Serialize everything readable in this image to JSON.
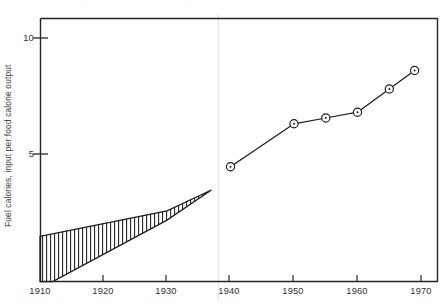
{
  "figure": {
    "title": "",
    "y_axis_label": "Fuel calories, input per food calorie output",
    "ghost_marks": [
      "..",
      "."
    ]
  },
  "axes": {
    "x_ticks": [
      "1910",
      "1920",
      "1930",
      "1940",
      "1950",
      "1960",
      "1970"
    ],
    "y_ticks": [
      "5",
      "10"
    ]
  },
  "chart_data": {
    "type": "line",
    "title": "",
    "xlabel": "",
    "ylabel": "Fuel calories, input per food calorie output",
    "xlim": [
      1910,
      1970
    ],
    "ylim": [
      0,
      10.9
    ],
    "x_ticks": [
      1910,
      1920,
      1930,
      1940,
      1950,
      1960,
      1970
    ],
    "y_ticks": [
      5,
      10
    ],
    "grid": false,
    "legend": null,
    "series": [
      {
        "name": "Fuel calories per food calorie",
        "marker": "circle-with-dot",
        "x": [
          1940,
          1950,
          1955,
          1960,
          1965,
          1969
        ],
        "values": [
          4.45,
          6.3,
          6.55,
          6.8,
          7.8,
          8.6
        ]
      },
      {
        "name": "Estimated range (upper bound)",
        "marker": "none",
        "x": [
          1910,
          1930,
          1937
        ],
        "values": [
          1.45,
          2.55,
          3.45
        ]
      },
      {
        "name": "Estimated range (lower bound)",
        "marker": "none",
        "x": [
          1912,
          1930,
          1937
        ],
        "values": [
          0.0,
          2.15,
          3.45
        ]
      }
    ],
    "annotations": [
      {
        "type": "hatched-band",
        "description": "Vertical line hatching between upper and lower estimate bounds, 1910-1937"
      }
    ]
  }
}
